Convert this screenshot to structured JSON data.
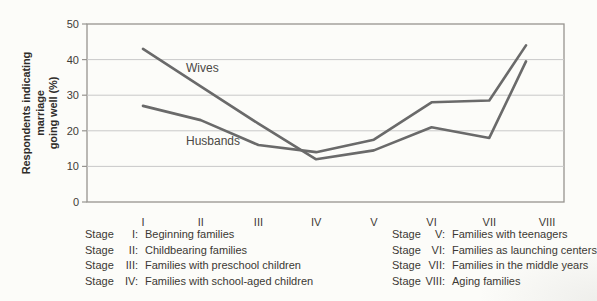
{
  "chart_data": {
    "type": "line",
    "title": "",
    "ylabel_line1": "Respondents indicating marriage",
    "ylabel_line2": "going well (%)",
    "xlabel": "",
    "categories": [
      "I",
      "II",
      "III",
      "IV",
      "V",
      "VI",
      "VII",
      "VIII"
    ],
    "yticks": [
      0,
      10,
      20,
      30,
      40,
      50
    ],
    "ylim": [
      0,
      50
    ],
    "grid": "horizontal gridlines every 10",
    "legend_position": "inline labels next to lines",
    "series": [
      {
        "name": "Wives",
        "values": [
          43,
          32.5,
          22,
          12,
          14.5,
          21,
          18,
          39.5
        ]
      },
      {
        "name": "Husbands",
        "values": [
          27,
          23,
          16,
          14,
          17.5,
          28,
          28.5,
          44
        ]
      }
    ],
    "layout_hints": {
      "final_points_plotted_left_of_last_tick": true
    }
  },
  "colors": {
    "line": "#6a6a6a",
    "grid": "#c9c9c9",
    "axis": "#979490",
    "text": "#3f3b36",
    "background": "#fcfcf9"
  },
  "stage_legend": {
    "stage_word": "Stage",
    "left": [
      {
        "numeral": "I:",
        "description": "Beginning families"
      },
      {
        "numeral": "II:",
        "description": "Childbearing families"
      },
      {
        "numeral": "III:",
        "description": "Families with preschool children"
      },
      {
        "numeral": "IV:",
        "description": "Families with school-aged children"
      }
    ],
    "right": [
      {
        "numeral": "V:",
        "description": "Families with teenagers"
      },
      {
        "numeral": "VI:",
        "description": "Families as launching centers"
      },
      {
        "numeral": "VII:",
        "description": "Families in the middle years"
      },
      {
        "numeral": "VIII:",
        "description": "Aging families"
      }
    ]
  }
}
